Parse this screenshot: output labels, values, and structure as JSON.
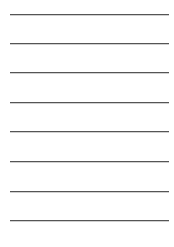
{
  "page": {
    "type": "lined-sheet",
    "background_color": "#ffffff",
    "rule_color": "#555555",
    "rule_left": 10,
    "rule_width": 159,
    "rules": [
      {
        "y": 14
      },
      {
        "y": 43
      },
      {
        "y": 72
      },
      {
        "y": 102
      },
      {
        "y": 131
      },
      {
        "y": 161
      },
      {
        "y": 191
      },
      {
        "y": 220
      }
    ]
  }
}
